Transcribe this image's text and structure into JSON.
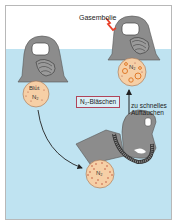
{
  "diagram": {
    "labels": {
      "gas_embolism": "Gasembolie",
      "n2_bubbles": "N₂-Bläschen",
      "ascent_line1": "zu schnelles",
      "ascent_line2": "Auftauchen",
      "blood": "Blut",
      "n2_dissolved": "N₂",
      "n2_deep": "N₂",
      "n2_surface": "N₂"
    },
    "colors": {
      "water": "#bfe3f1",
      "air": "#ffffff",
      "diver": "#8c8c8c",
      "blood_circle": "#f6cfa6",
      "bubble_outline": "#e07a2a",
      "lightning": "#e8412a",
      "label_box_border": "#b0455a"
    },
    "elements": [
      "diver-left-surface",
      "diver-right-surface",
      "diver-deep",
      "blood-circle-initial",
      "blood-circle-bubbles",
      "blood-circle-deep",
      "descent-arrow",
      "ascent-arrow"
    ]
  }
}
